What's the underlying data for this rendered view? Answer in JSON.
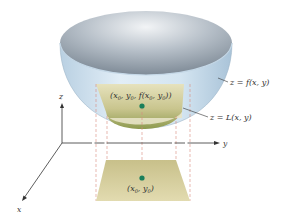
{
  "diagram": {
    "axes": {
      "x_label": "x",
      "y_label": "y",
      "z_label": "z"
    },
    "surface_label": "z = f(x, y)",
    "plane_label": "z = L(x, y)",
    "point_on_surface_label": {
      "open": "(",
      "x": "x",
      "x_sub": "0",
      "sep1": ", ",
      "y": "y",
      "y_sub": "0",
      "sep2": ", ",
      "f": "f",
      "fopen": "(",
      "fx": "x",
      "fx_sub": "0",
      "fsep": ", ",
      "fy": "y",
      "fy_sub": "0",
      "close": "))"
    },
    "base_point_label": {
      "open": "(",
      "x": "x",
      "x_sub": "0",
      "sep": ", ",
      "y": "y",
      "y_sub": "0",
      "close": ")"
    },
    "colors": {
      "bowl_outer": "#cfe1ee",
      "bowl_inner": "#a9b4bf",
      "plane": "#d8d2a4",
      "plane_dark": "#8f9a52",
      "point": "#1a7f5a",
      "dashed": "#d97a6a",
      "axis": "#333333"
    }
  }
}
